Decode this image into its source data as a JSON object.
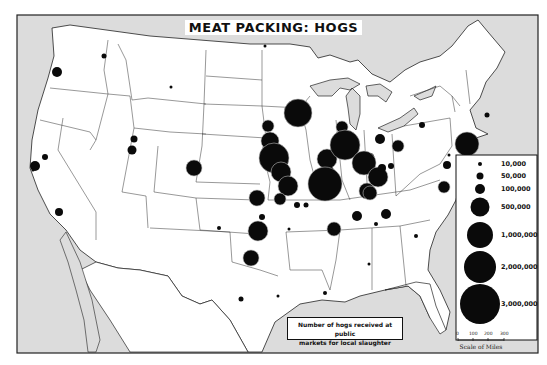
{
  "title": "MEAT PACKING: HOGS",
  "caption": {
    "line1": "Number of hogs received at public",
    "line2": "markets for local slaughter"
  },
  "legend": {
    "items": [
      {
        "label": "10,000",
        "r": 2
      },
      {
        "label": "50,000",
        "r": 3.5
      },
      {
        "label": "100,000",
        "r": 5
      },
      {
        "label": "500,000",
        "r": 9.5
      },
      {
        "label": "1,000,000",
        "r": 13
      },
      {
        "label": "2,000,000",
        "r": 16
      },
      {
        "label": "3,000,000",
        "r": 20
      }
    ]
  },
  "scale": {
    "ticks": [
      "0",
      "100",
      "200",
      "300"
    ],
    "label": "Scale of Miles"
  },
  "colors": {
    "water": "#dcdcdc",
    "land": "#ffffff",
    "border": "#222222",
    "dot": "#0a0a0a"
  },
  "markets": [
    {
      "x": 57,
      "y": 72,
      "r": 5
    },
    {
      "x": 104,
      "y": 56,
      "r": 2.5
    },
    {
      "x": 171,
      "y": 87,
      "r": 1.5
    },
    {
      "x": 134,
      "y": 139,
      "r": 3.5
    },
    {
      "x": 132,
      "y": 150,
      "r": 4.5
    },
    {
      "x": 45,
      "y": 157,
      "r": 3
    },
    {
      "x": 35,
      "y": 166,
      "r": 5
    },
    {
      "x": 59,
      "y": 212,
      "r": 4
    },
    {
      "x": 194,
      "y": 168,
      "r": 8
    },
    {
      "x": 219,
      "y": 228,
      "r": 2
    },
    {
      "x": 265,
      "y": 46,
      "r": 1.5
    },
    {
      "x": 298,
      "y": 113,
      "r": 14
    },
    {
      "x": 268,
      "y": 126,
      "r": 6
    },
    {
      "x": 270,
      "y": 141,
      "r": 9
    },
    {
      "x": 274,
      "y": 158,
      "r": 15
    },
    {
      "x": 281,
      "y": 172,
      "r": 10
    },
    {
      "x": 288,
      "y": 186,
      "r": 10
    },
    {
      "x": 257,
      "y": 198,
      "r": 8
    },
    {
      "x": 280,
      "y": 199,
      "r": 6
    },
    {
      "x": 297,
      "y": 205,
      "r": 3
    },
    {
      "x": 262,
      "y": 217,
      "r": 3
    },
    {
      "x": 258,
      "y": 231,
      "r": 10
    },
    {
      "x": 289,
      "y": 229,
      "r": 1.5
    },
    {
      "x": 251,
      "y": 258,
      "r": 8
    },
    {
      "x": 241,
      "y": 299,
      "r": 2.5
    },
    {
      "x": 278,
      "y": 296,
      "r": 1.5
    },
    {
      "x": 306,
      "y": 205,
      "r": 2.5
    },
    {
      "x": 327,
      "y": 159,
      "r": 10
    },
    {
      "x": 329,
      "y": 171,
      "r": 5
    },
    {
      "x": 325,
      "y": 184,
      "r": 17
    },
    {
      "x": 342,
      "y": 127,
      "r": 6
    },
    {
      "x": 345,
      "y": 145,
      "r": 15
    },
    {
      "x": 367,
      "y": 191,
      "r": 8
    },
    {
      "x": 370,
      "y": 157,
      "r": 4
    },
    {
      "x": 364,
      "y": 163,
      "r": 12
    },
    {
      "x": 378,
      "y": 177,
      "r": 10
    },
    {
      "x": 370,
      "y": 193,
      "r": 7
    },
    {
      "x": 382,
      "y": 168,
      "r": 4
    },
    {
      "x": 391,
      "y": 166,
      "r": 3
    },
    {
      "x": 398,
      "y": 146,
      "r": 6
    },
    {
      "x": 380,
      "y": 139,
      "r": 5
    },
    {
      "x": 422,
      "y": 125,
      "r": 3
    },
    {
      "x": 467,
      "y": 144,
      "r": 12
    },
    {
      "x": 487,
      "y": 115,
      "r": 2.5
    },
    {
      "x": 449,
      "y": 155,
      "r": 1.5
    },
    {
      "x": 447,
      "y": 165,
      "r": 4
    },
    {
      "x": 444,
      "y": 187,
      "r": 6
    },
    {
      "x": 357,
      "y": 216,
      "r": 5
    },
    {
      "x": 386,
      "y": 214,
      "r": 5
    },
    {
      "x": 376,
      "y": 224,
      "r": 2
    },
    {
      "x": 334,
      "y": 229,
      "r": 7
    },
    {
      "x": 416,
      "y": 236,
      "r": 2
    },
    {
      "x": 369,
      "y": 264,
      "r": 1.5
    },
    {
      "x": 325,
      "y": 293,
      "r": 2
    },
    {
      "x": 33,
      "y": 170,
      "r": 1.5
    }
  ]
}
